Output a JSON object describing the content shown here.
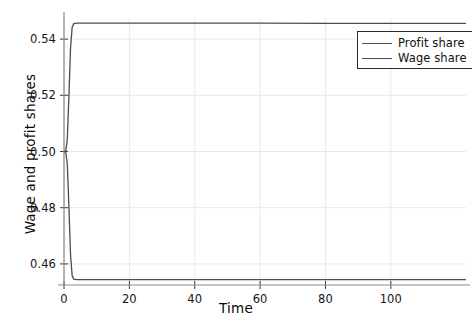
{
  "chart_data": {
    "type": "line",
    "title": "",
    "xlabel": "Time",
    "ylabel": "Wage and profit shares",
    "xlim": [
      0,
      123
    ],
    "ylim": [
      0.4525,
      0.5475
    ],
    "xticks": [
      0,
      20,
      40,
      60,
      80,
      100
    ],
    "xtick_labels": [
      "0",
      "20",
      "40",
      "60",
      "80",
      "100"
    ],
    "yticks": [
      0.46,
      0.48,
      0.5,
      0.52,
      0.54
    ],
    "ytick_labels": [
      "0.46",
      "0.48",
      "0.50",
      "0.52",
      "0.54"
    ],
    "grid": true,
    "legend_position": "upper right",
    "series": [
      {
        "name": "Profit share",
        "color": "#4d4d4d",
        "plateau_value": 0.5457,
        "start_value": 0.5,
        "x": [
          0,
          0.5,
          1,
          1.5,
          2,
          2.5,
          3,
          4,
          6,
          10,
          20,
          40,
          60,
          80,
          100,
          120,
          123
        ],
        "values": [
          0.5,
          0.5,
          0.5042,
          0.5195,
          0.5368,
          0.5442,
          0.5455,
          0.5457,
          0.5457,
          0.5457,
          0.5457,
          0.5457,
          0.5457,
          0.5456,
          0.5456,
          0.5456,
          0.5456
        ]
      },
      {
        "name": "Wage share",
        "color": "#4d4d4d",
        "plateau_value": 0.4545,
        "start_value": 0.5,
        "x": [
          0,
          0.5,
          1,
          1.5,
          2,
          2.5,
          3,
          4,
          6,
          10,
          20,
          40,
          60,
          80,
          100,
          120,
          123
        ],
        "values": [
          0.5,
          0.5,
          0.4958,
          0.4805,
          0.4632,
          0.4558,
          0.4546,
          0.4544,
          0.4544,
          0.4544,
          0.4544,
          0.4544,
          0.4544,
          0.4544,
          0.4544,
          0.4544,
          0.4544
        ]
      }
    ],
    "legend_entries": [
      "Profit share",
      "Wage share"
    ],
    "axis_color": "#8a8a8a",
    "grid_color": "#e8e8e8",
    "background": "#ffffff"
  }
}
